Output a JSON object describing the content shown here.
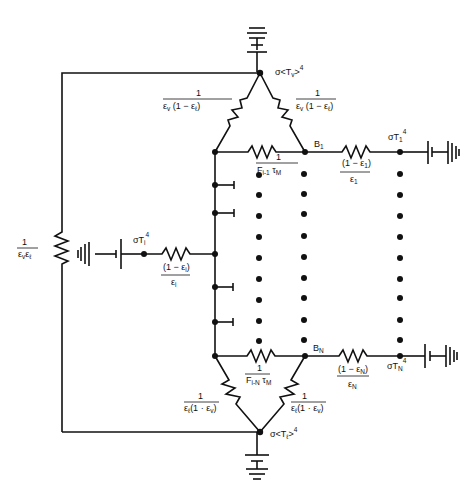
{
  "diagram": {
    "type": "thermal radiation resistance network",
    "nodes": {
      "top": {
        "label": "σ<T",
        "sub": "v",
        "tail": ">",
        "sup": "4"
      },
      "bottom": {
        "label": "σ<T",
        "sub": "ℓ",
        "tail": ">",
        "sup": "4"
      },
      "left_source": {
        "label": "σT",
        "sub": "i",
        "sup": "4"
      },
      "b1": {
        "label": "B",
        "sub": "1"
      },
      "bn": {
        "label": "B",
        "sub": "N"
      },
      "t1": {
        "label": "σT",
        "sub": "1",
        "sup": "4"
      },
      "tn": {
        "label": "σT",
        "sub": "N",
        "sup": "4"
      }
    },
    "resistors": {
      "left_vertical": {
        "num": "1",
        "den": "ε",
        "den_sub1": "v",
        "den_mid": "ε",
        "den_sub2": "ℓ"
      },
      "top_left": {
        "num": "1",
        "den": "ε",
        "den_sub1": "v",
        "den_rest": " (1 − ε",
        "den_sub2": "ℓ",
        "den_end": ")"
      },
      "top_right": {
        "num": "1",
        "den": "ε",
        "den_sub1": "v",
        "den_rest": " (1 − ε",
        "den_sub2": "ℓ",
        "den_end": ")"
      },
      "top_horizontal": {
        "num": "1",
        "den": "F",
        "den_sub1": "i-1",
        "den_rest": " τ",
        "den_sub2": "M"
      },
      "b1_to_t1": {
        "num": "(1 − ε",
        "num_sub": "1",
        "num_end": ")",
        "den": "ε",
        "den_sub": "1"
      },
      "left_branch": {
        "num": "(1 − ε",
        "num_sub": "i",
        "num_end": ")",
        "den": "ε",
        "den_sub": "i"
      },
      "bottom_horizontal": {
        "num": "1",
        "den": "F",
        "den_sub1": "i-N",
        "den_rest": " τ",
        "den_sub2": "M"
      },
      "bn_to_tn": {
        "num": "(1 − ε",
        "num_sub": "N",
        "num_end": ")",
        "den": "ε",
        "den_sub": "N"
      },
      "bottom_left": {
        "num": "1",
        "den": "ε",
        "den_sub1": "ℓ",
        "den_rest": "(1 · ε",
        "den_sub2": "v",
        "den_end": ")"
      },
      "bottom_right": {
        "num": "1",
        "den": "ε",
        "den_sub1": "ℓ",
        "den_rest": "(1 · ε",
        "den_sub2": "v",
        "den_end": ")"
      }
    }
  }
}
